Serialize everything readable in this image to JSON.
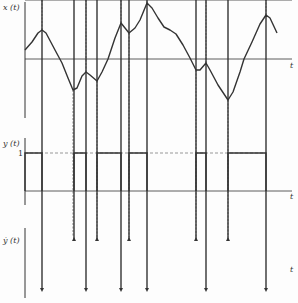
{
  "diagram": {
    "colors": {
      "line": "#333333",
      "dashed": "#555555",
      "background": "#fdfdfd"
    },
    "panels": [
      {
        "id": "x",
        "y_label": "x (t)",
        "x_label": "t",
        "axis": {
          "x": 25,
          "y_top": 2,
          "y_bottom": 118,
          "baseline_y": 59,
          "x_end": 292
        },
        "curve_points": [
          [
            25,
            50
          ],
          [
            32,
            42
          ],
          [
            38,
            33
          ],
          [
            42,
            30
          ],
          [
            46,
            33
          ],
          [
            55,
            50
          ],
          [
            62,
            63
          ],
          [
            68,
            78
          ],
          [
            73,
            90
          ],
          [
            77,
            88
          ],
          [
            82,
            76
          ],
          [
            86,
            72
          ],
          [
            90,
            75
          ],
          [
            97,
            81
          ],
          [
            102,
            72
          ],
          [
            108,
            59
          ],
          [
            115,
            38
          ],
          [
            121,
            23
          ],
          [
            125,
            28
          ],
          [
            129,
            33
          ],
          [
            135,
            28
          ],
          [
            140,
            20
          ],
          [
            147,
            3
          ],
          [
            152,
            8
          ],
          [
            158,
            18
          ],
          [
            164,
            27
          ],
          [
            170,
            30
          ],
          [
            176,
            34
          ],
          [
            183,
            45
          ],
          [
            190,
            58
          ],
          [
            196,
            70
          ],
          [
            200,
            70
          ],
          [
            206,
            63
          ],
          [
            210,
            70
          ],
          [
            218,
            85
          ],
          [
            228,
            100
          ],
          [
            233,
            92
          ],
          [
            240,
            72
          ],
          [
            244,
            59
          ],
          [
            252,
            42
          ],
          [
            260,
            24
          ],
          [
            266,
            15
          ],
          [
            270,
            18
          ],
          [
            277,
            33
          ]
        ],
        "extrema_x": [
          42,
          73,
          86,
          97,
          121,
          129,
          147,
          196,
          206,
          228,
          266
        ]
      },
      {
        "id": "y",
        "y_label": "y (t)",
        "x_label": "t",
        "level_label": "1",
        "axis": {
          "x": 25,
          "y_top": 138,
          "y_bottom": 205,
          "baseline_y": 191,
          "level_y": 153,
          "x_end": 292
        },
        "pulses": [
          [
            25,
            42
          ],
          [
            74,
            86
          ],
          [
            97,
            121
          ],
          [
            129,
            147
          ],
          [
            196,
            206
          ],
          [
            228,
            266
          ]
        ]
      },
      {
        "id": "ydot",
        "y_label": "ẏ (t)",
        "x_label": "t",
        "axis": {
          "x": 25,
          "y_top": 228,
          "y_bottom": 298,
          "baseline_y": 264,
          "x_end": 292
        },
        "up_arrow_tip_y": 237,
        "down_arrow_tip_y": 292,
        "impulses_up_x": [
          74,
          97,
          129,
          196,
          228
        ],
        "impulses_down_x": [
          42,
          86,
          121,
          147,
          206,
          266
        ]
      }
    ],
    "dashed_lines_x": [
      42,
      73,
      86,
      97,
      121,
      129,
      147,
      196,
      206,
      228,
      266
    ]
  }
}
